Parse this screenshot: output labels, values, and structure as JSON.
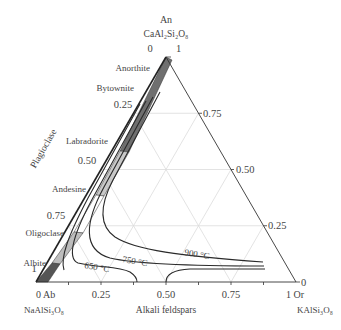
{
  "vertices": {
    "top": {
      "name": "An",
      "formula": "CaAl₂Si₂O₈"
    },
    "left": {
      "name": "0 Ab",
      "formula": "NaAlSi₃O₈"
    },
    "right": {
      "name": "1 Or",
      "formula": "KAlSi₃O₈"
    }
  },
  "axis_labels": {
    "left_side": "Plagioclase",
    "bottom": "Alkali feldspars"
  },
  "ticks": {
    "bottom": [
      "0.25",
      "0.50",
      "0.75"
    ],
    "left": [
      "0",
      "0.25",
      "0.50",
      "0.75",
      "1"
    ],
    "right": [
      "1",
      "0.75",
      "0.50",
      "0.25",
      "0"
    ]
  },
  "plagioclase_series": [
    {
      "name": "Anorthite",
      "range": [
        0.9,
        1.0
      ]
    },
    {
      "name": "Bytownite",
      "range": [
        0.7,
        0.9
      ]
    },
    {
      "name": "Labradorite",
      "range": [
        0.5,
        0.7
      ]
    },
    {
      "name": "Andesine",
      "range": [
        0.3,
        0.5
      ]
    },
    {
      "name": "Oligoclase",
      "range": [
        0.1,
        0.3
      ]
    },
    {
      "name": "Albite",
      "range": [
        0.0,
        0.1
      ]
    }
  ],
  "isotherms": [
    {
      "label": "900 °C"
    },
    {
      "label": "750 °C"
    },
    {
      "label": "650 °C"
    }
  ],
  "colors": {
    "band_dark": "#6a6a6a",
    "band_light": "#c8c8c8",
    "grid": "#dddddd",
    "line": "#333333"
  }
}
